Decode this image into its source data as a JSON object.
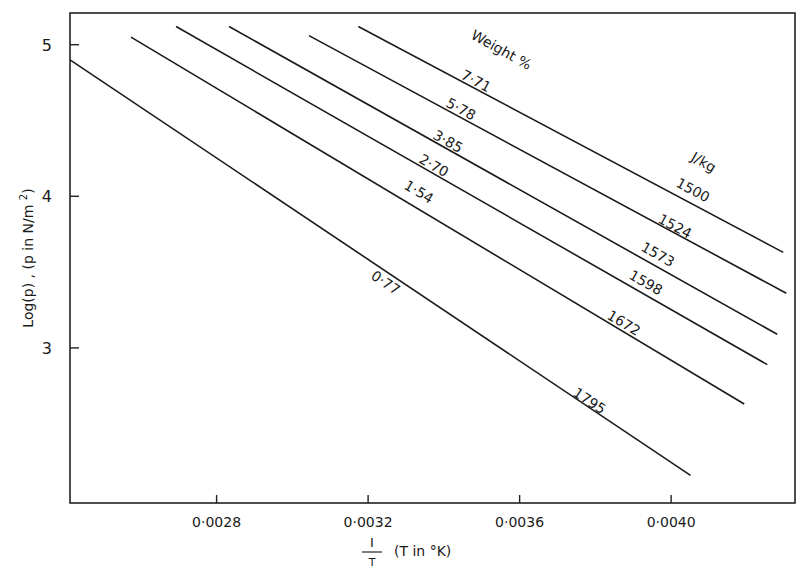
{
  "chart_data": {
    "type": "line",
    "title": "",
    "xlabel": "1/T  (T in °K)",
    "xlabel_parts": {
      "numerator": "I",
      "denominator": "T",
      "suffix": "(T in °K)"
    },
    "ylabel": "Log(p) , (p in N/m²)",
    "xlim": [
      0.002413,
      0.004327
    ],
    "ylim": [
      1.977,
      5.209
    ],
    "x_ticks": [
      0.0028,
      0.0032,
      0.0036,
      0.004
    ],
    "x_tick_labels": [
      "0·0028",
      "0·0032",
      "0·0036",
      "0·0040"
    ],
    "y_ticks": [
      3,
      4,
      5
    ],
    "y_tick_labels": [
      "3",
      "4",
      "5"
    ],
    "grid": false,
    "legend": "inline labels on lines",
    "series_group_labels": {
      "left": "Weight %",
      "right": "J/kg"
    },
    "series": [
      {
        "name": "0.77 wt% (1795 J/kg)",
        "weight_label": "0·77",
        "energy_label": "1795",
        "x": [
          0.002413,
          0.004051
        ],
        "y": [
          4.9,
          2.16
        ]
      },
      {
        "name": "1.54 wt% (1672 J/kg)",
        "weight_label": "1·54",
        "energy_label": "1672",
        "x": [
          0.002574,
          0.004193
        ],
        "y": [
          5.05,
          2.63
        ]
      },
      {
        "name": "2.70 wt% (1598 J/kg)",
        "weight_label": "2·70",
        "energy_label": "1598",
        "x": [
          0.002693,
          0.004254
        ],
        "y": [
          5.12,
          2.89
        ]
      },
      {
        "name": "3.85 wt% (1573 J/kg)",
        "weight_label": "3·85",
        "energy_label": "1573",
        "x": [
          0.002833,
          0.00428
        ],
        "y": [
          5.12,
          3.09
        ]
      },
      {
        "name": "5.78 wt% (1524 J/kg)",
        "weight_label": "5·78",
        "energy_label": "1524",
        "x": [
          0.003044,
          0.004304
        ],
        "y": [
          5.06,
          3.36
        ]
      },
      {
        "name": "7.71 wt% (1500 J/kg)",
        "weight_label": "7·71",
        "energy_label": "1500",
        "x": [
          0.003174,
          0.004296
        ],
        "y": [
          5.12,
          3.63
        ]
      }
    ]
  }
}
